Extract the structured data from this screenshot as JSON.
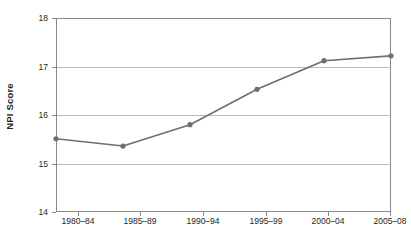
{
  "chart_data": {
    "type": "line",
    "title": "",
    "xlabel": "",
    "ylabel": "NPI Score",
    "categories": [
      "1980–84",
      "1985–89",
      "1990–94",
      "1995–99",
      "2000–04",
      "2005–08"
    ],
    "values": [
      15.51,
      15.36,
      15.8,
      16.53,
      17.12,
      17.22
    ],
    "series": [
      {
        "name": "NPI Score",
        "values": [
          15.51,
          15.36,
          15.8,
          16.53,
          17.12,
          17.22
        ]
      }
    ],
    "ylim": [
      14,
      18
    ],
    "xlim": [
      0,
      5
    ],
    "y_ticks": [
      "18",
      "17",
      "16",
      "15",
      "14"
    ],
    "y_tick_values": [
      18,
      17,
      16,
      15,
      14
    ],
    "grid": true,
    "grid_axis": "y",
    "legend": "none",
    "markers": "circle",
    "colors": {
      "line": "#6e6e78",
      "marker": "#6e6e78",
      "grid": "#b9b9b9",
      "axis": "#8a8a8a",
      "text": "#231f20",
      "background": "#ffffff"
    }
  }
}
